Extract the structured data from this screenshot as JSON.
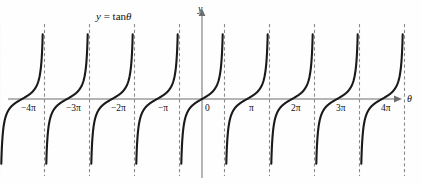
{
  "figure": {
    "title": "y = tanθ",
    "title_pos": {
      "x": 96,
      "y": 11
    },
    "background": "#fefefe",
    "curve_color": "#1a1a1a",
    "axis_color": "#6d6d6d",
    "asymptote_color": "#8a8a8a",
    "width": 422,
    "height": 184
  },
  "axes": {
    "x_axis_label": "θ",
    "y_axis_label": "y",
    "x_axis_label_pos": {
      "x": 407,
      "y": 94
    },
    "y_axis_label_pos": {
      "x": 198,
      "y": 4
    },
    "origin_label": "0",
    "origin_label_pos": {
      "x": 205,
      "y": 104
    },
    "origin_px": {
      "x": 202,
      "y": 99
    },
    "x_axis_y_px": 99,
    "y_axis_x_px": 202,
    "px_per_pi": 45.0,
    "x_axis_from_px": 8,
    "x_axis_to_px": 398,
    "y_axis_top_px": 12,
    "y_axis_bottom_px": 178
  },
  "chart_data": {
    "type": "line",
    "title": "y = tanθ",
    "xlabel": "θ",
    "ylabel": "y",
    "function": "y = tan(theta)",
    "grid": false,
    "legend": false,
    "xlim": [
      -4.6,
      4.6
    ],
    "ylim": [
      -3.2,
      3.2
    ],
    "xlim_units": "pi",
    "xticks": [
      -4,
      -3,
      -2,
      -1,
      0,
      1,
      2,
      3,
      4
    ],
    "xticklabels": [
      "−4π",
      "−3π",
      "−2π",
      "−π",
      "0",
      "π",
      "2π",
      "3π",
      "4π"
    ],
    "xtick_px": [
      22,
      67,
      112,
      157,
      202,
      247,
      292,
      337,
      382
    ],
    "xtick_label_px": [
      {
        "label": "−4π",
        "x": 21,
        "y": 104
      },
      {
        "label": "−3π",
        "x": 66,
        "y": 104
      },
      {
        "label": "−2π",
        "x": 111,
        "y": 104
      },
      {
        "label": "−π",
        "x": 158,
        "y": 104
      },
      {
        "label": "0",
        "x": 205,
        "y": 104
      },
      {
        "label": "π",
        "x": 249,
        "y": 104
      },
      {
        "label": "2π",
        "x": 291,
        "y": 104
      },
      {
        "label": "3π",
        "x": 336,
        "y": 104
      },
      {
        "label": "4π",
        "x": 381,
        "y": 104
      }
    ],
    "yticks": [],
    "yticklabels": [],
    "asymptotes_units_pi": [
      -4.5,
      -3.5,
      -2.5,
      -1.5,
      -0.5,
      0.5,
      1.5,
      2.5,
      3.5,
      4.5
    ],
    "asymptotes_px": [
      -0.5,
      44.5,
      89.5,
      134.5,
      179.5,
      224.5,
      269.5,
      314.5,
      359.5,
      404.5
    ],
    "asymptote_style": "dashed",
    "branch_count": 9,
    "branch_centers_units_pi": [
      -4,
      -3,
      -2,
      -1,
      0,
      1,
      2,
      3,
      4
    ],
    "branch_centers_px": [
      22,
      67,
      112,
      157,
      202,
      247,
      292,
      337,
      382
    ],
    "branch_top_px": 26,
    "branch_bottom_px": 173
  }
}
